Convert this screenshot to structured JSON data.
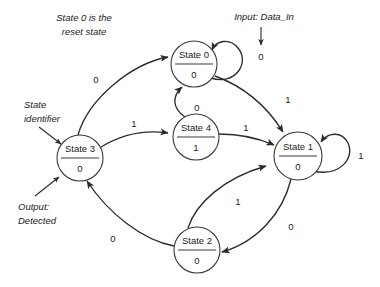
{
  "diagram": {
    "kind": "finite-state-machine",
    "title_visible": false,
    "background_color": "#ffffff",
    "line_color": "#2b2b2b",
    "text_color": "#1a1a1a",
    "states": [
      {
        "id": "s0",
        "label": "State 0",
        "output": "0",
        "cx": 194,
        "cy": 64,
        "r": 23
      },
      {
        "id": "s4",
        "label": "State 4",
        "output": "1",
        "cx": 196,
        "cy": 137,
        "r": 23
      },
      {
        "id": "s3",
        "label": "State 3",
        "output": "0",
        "cx": 80,
        "cy": 158,
        "r": 23
      },
      {
        "id": "s1",
        "label": "State 1",
        "output": "0",
        "cx": 298,
        "cy": 156,
        "r": 24
      },
      {
        "id": "s2",
        "label": "State 2",
        "output": "0",
        "cx": 197,
        "cy": 250,
        "r": 23
      }
    ],
    "transitions": [
      {
        "from": "s0",
        "to": "s0",
        "input": "0",
        "label_x": 261,
        "label_y": 57,
        "kind": "self-loop"
      },
      {
        "from": "s3",
        "to": "s0",
        "input": "0",
        "label_x": 96,
        "label_y": 80,
        "kind": "curve"
      },
      {
        "from": "s3",
        "to": "s4",
        "input": "1",
        "label_x": 134,
        "label_y": 124,
        "kind": "curve"
      },
      {
        "from": "s4",
        "to": "s0",
        "input": "0",
        "label_x": 197,
        "label_y": 108,
        "kind": "curve"
      },
      {
        "from": "s0",
        "to": "s1",
        "input": "1",
        "label_x": 288,
        "label_y": 100,
        "kind": "curve"
      },
      {
        "from": "s4",
        "to": "s1",
        "input": "1",
        "label_x": 246,
        "label_y": 128,
        "kind": "curve"
      },
      {
        "from": "s1",
        "to": "s1",
        "input": "1",
        "label_x": 361,
        "label_y": 156,
        "kind": "self-loop"
      },
      {
        "from": "s1",
        "to": "s2",
        "input": "0",
        "label_x": 291,
        "label_y": 227,
        "kind": "curve"
      },
      {
        "from": "s2",
        "to": "s1",
        "input": "1",
        "label_x": 238,
        "label_y": 202,
        "kind": "curve"
      },
      {
        "from": "s2",
        "to": "s3",
        "input": "0",
        "label_x": 113,
        "label_y": 239,
        "kind": "curve"
      }
    ],
    "annotations": [
      {
        "id": "reset-note",
        "lines": [
          "State 0 is the",
          "reset state"
        ],
        "x": 84,
        "y": 18,
        "align": "center",
        "has_arrow": false
      },
      {
        "id": "state-identifier-note",
        "lines": [
          "State",
          "identifier"
        ],
        "x": 24,
        "y": 105,
        "align": "start",
        "has_arrow": true
      },
      {
        "id": "output-note",
        "lines": [
          "Output:",
          "Detected"
        ],
        "x": 18,
        "y": 207,
        "align": "start",
        "has_arrow": true
      },
      {
        "id": "input-note",
        "lines": [
          "Input: Data_In"
        ],
        "x": 264,
        "y": 17,
        "align": "center",
        "has_arrow": true
      }
    ]
  }
}
